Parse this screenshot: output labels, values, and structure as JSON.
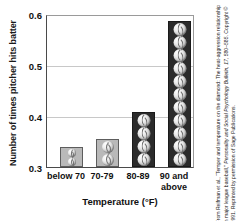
{
  "chart_data": {
    "type": "bar",
    "title": "",
    "xlabel": "Temperature (°F)",
    "ylabel": "Number of times pitcher hits batter",
    "categories": [
      "below 70",
      "70-79",
      "80-89",
      "90 and\nabove"
    ],
    "values": [
      0.34,
      0.355,
      0.41,
      0.59
    ],
    "ylim": [
      0.3,
      0.6
    ],
    "yticks": [
      "0.3",
      "0.4",
      "0.5",
      "0.6"
    ],
    "ytick_values": [
      0.3,
      0.4,
      0.5,
      0.6
    ],
    "grid": true,
    "legend": "none",
    "bar_fills": [
      "#b9b9b9",
      "#b9b9b9",
      "#2b2b2b",
      "#2b2b2b"
    ],
    "bar_icon": "baseball",
    "baseball_counts": [
      2,
      2,
      4,
      11
    ]
  },
  "credit": {
    "line1": "From Reifman et al., “Temper and temperature on the diamond: The",
    "line2": "heat-aggression relationship in major league baseball,” ",
    "line2_italic": "Personality and",
    "line3_italic": "Social Psychology Bulletin, 17,",
    "line3": " 580–585. Copyright © 1991. Reprinted",
    "line4": "by permission of Sage Publications."
  },
  "colors": {
    "axis": "#4a4a4a",
    "grid": "#c8c8c8",
    "text": "#111111",
    "bar_light": "#b9b9b9",
    "bar_dark": "#2b2b2b"
  }
}
